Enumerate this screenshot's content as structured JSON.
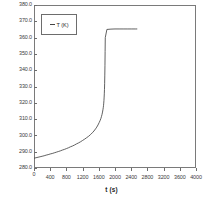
{
  "chart_data": {
    "type": "line",
    "title": "",
    "xlabel": "t (s)",
    "ylabel": "",
    "xlim": [
      0,
      4000
    ],
    "ylim": [
      280.0,
      380.0
    ],
    "grid": false,
    "legend_position": "top-left-inside",
    "x_ticks": [
      0,
      400,
      800,
      1200,
      1600,
      2000,
      2400,
      2800,
      3200,
      3600,
      4000
    ],
    "x_tick_labels": [
      "0",
      "400",
      "800",
      "1200",
      "1600",
      "2000",
      "2400",
      "2800",
      "3200",
      "3600",
      "4000"
    ],
    "y_ticks": [
      280.0,
      290.0,
      300.0,
      310.0,
      320.0,
      330.0,
      340.0,
      350.0,
      360.0,
      370.0,
      380.0
    ],
    "y_tick_labels": [
      "280.0",
      "290.0",
      "300.0",
      "310.0",
      "320.0",
      "330.0",
      "340.0",
      "350.0",
      "360.0",
      "370.0",
      "380.0"
    ],
    "series": [
      {
        "name": "T (K)",
        "color": "#444444",
        "x": [
          0,
          50,
          100,
          150,
          200,
          250,
          300,
          350,
          400,
          450,
          500,
          550,
          600,
          650,
          700,
          750,
          800,
          850,
          900,
          950,
          1000,
          1050,
          1100,
          1150,
          1200,
          1250,
          1300,
          1350,
          1400,
          1440,
          1480,
          1520,
          1550,
          1580,
          1610,
          1630,
          1650,
          1665,
          1680,
          1692,
          1702,
          1710,
          1716,
          1722,
          1727,
          1732,
          1736,
          1740,
          1744,
          1748,
          1752,
          1756,
          1760,
          1800,
          1900,
          2000,
          2100,
          2200,
          2300,
          2400,
          2500,
          2550
        ],
        "y": [
          286.0,
          286.3,
          286.6,
          286.9,
          287.2,
          287.5,
          287.9,
          288.2,
          288.6,
          288.9,
          289.3,
          289.7,
          290.1,
          290.5,
          291.0,
          291.4,
          291.9,
          292.4,
          293.0,
          293.5,
          294.1,
          294.8,
          295.4,
          296.1,
          296.9,
          297.7,
          298.6,
          299.5,
          300.6,
          301.6,
          302.7,
          304.0,
          305.1,
          306.4,
          307.9,
          309.0,
          310.3,
          311.5,
          312.9,
          314.3,
          315.7,
          317.0,
          318.2,
          319.8,
          321.4,
          323.5,
          325.5,
          328.2,
          331.7,
          336.5,
          343.0,
          351.5,
          360.0,
          365.0,
          365.2,
          365.3,
          365.3,
          365.3,
          365.3,
          365.3,
          365.3,
          365.3
        ]
      }
    ],
    "legend": [
      {
        "label": "T (K)",
        "marker": "line",
        "color": "#444444"
      }
    ]
  },
  "axes": {
    "x_title": "t (s)"
  }
}
